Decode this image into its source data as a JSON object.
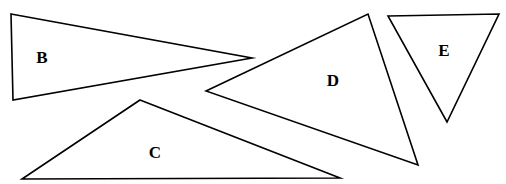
{
  "figure": {
    "background_color": "#ffffff",
    "stroke_color": "#000000",
    "label_color": "#000000",
    "width": 506,
    "height": 184,
    "shapes": [
      {
        "id": "triangle-b",
        "label": "B",
        "points": "11,14 252,58 13,100",
        "label_x": 42,
        "label_y": 57
      },
      {
        "id": "triangle-c",
        "label": "C",
        "points": "140,100 340,178 22,179",
        "label_x": 155,
        "label_y": 152
      },
      {
        "id": "triangle-d",
        "label": "D",
        "points": "206,91 368,14 418,165",
        "label_x": 333,
        "label_y": 80
      },
      {
        "id": "triangle-e",
        "label": "E",
        "points": "388,16 499,14 447,122",
        "label_x": 444,
        "label_y": 50
      }
    ]
  }
}
